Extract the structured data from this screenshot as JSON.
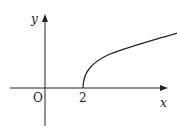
{
  "diagram": {
    "type": "function-graph",
    "axes": {
      "x_label": "x",
      "y_label": "y",
      "origin_label": "O"
    },
    "ticks": {
      "x": [
        "2"
      ]
    },
    "curve": {
      "start_point": [
        2,
        0
      ],
      "shape": "square-root, increasing, concave down"
    },
    "colors": {
      "axis": "#222222",
      "curve": "#222222",
      "background": "#ffffff"
    }
  }
}
